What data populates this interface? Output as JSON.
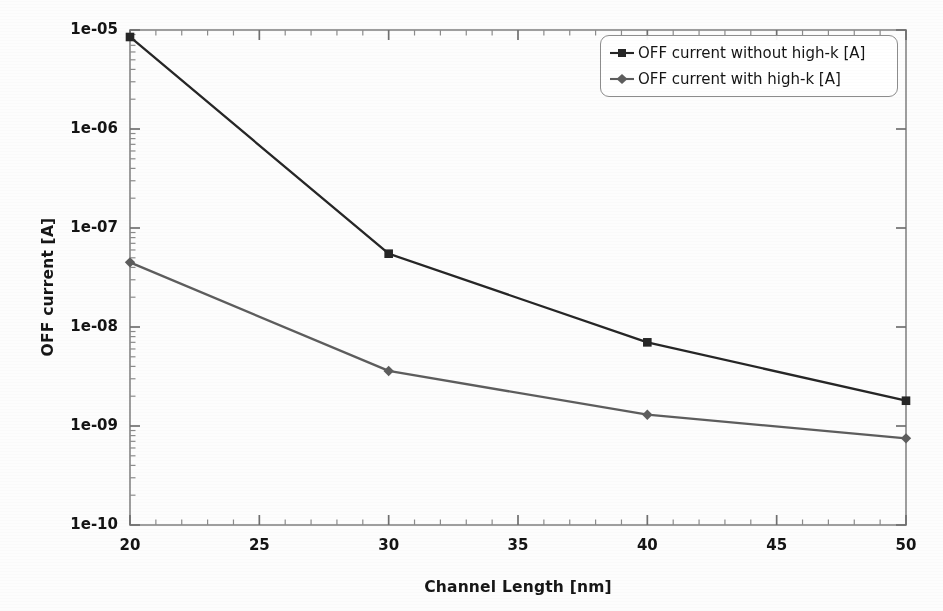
{
  "chart_data": {
    "type": "line",
    "title": "",
    "xlabel": "Channel Length [nm]",
    "ylabel": "OFF current [A]",
    "x": [
      20,
      30,
      40,
      50
    ],
    "xlim": [
      20,
      50
    ],
    "ylim": [
      1e-10,
      1e-05
    ],
    "yscale": "log",
    "xticks": [
      20,
      25,
      30,
      35,
      40,
      45,
      50
    ],
    "xtick_labels": [
      "20",
      "25",
      "30",
      "35",
      "40",
      "45",
      "50"
    ],
    "yticks": [
      1e-05,
      1e-06,
      1e-07,
      1e-08,
      1e-09,
      1e-10
    ],
    "ytick_labels": [
      "1e-05",
      "1e-06",
      "1e-07",
      "1e-08",
      "1e-09",
      "1e-10"
    ],
    "grid": false,
    "legend_position": "upper right",
    "series": [
      {
        "name": "OFF current without high-k [A]",
        "values": [
          8.5e-06,
          5.5e-08,
          7e-09,
          1.8e-09
        ],
        "color": "#262626",
        "marker": "square"
      },
      {
        "name": "OFF current with high-k [A]",
        "values": [
          4.5e-08,
          3.6e-09,
          1.3e-09,
          7.5e-10
        ],
        "color": "#5d5d5d",
        "marker": "diamond"
      }
    ]
  },
  "axes": {
    "ylabel_text": "OFF current [A]",
    "xlabel_text": "Channel Length [nm]",
    "ytick_labels": [
      "1e-05",
      "1e-06",
      "1e-07",
      "1e-08",
      "1e-09",
      "1e-10"
    ],
    "xtick_labels": [
      "20",
      "25",
      "30",
      "35",
      "40",
      "45",
      "50"
    ]
  },
  "legend": {
    "entries": [
      {
        "label": "OFF current without high-k [A]",
        "color": "#262626",
        "marker": "square"
      },
      {
        "label": "OFF current with high-k [A]",
        "color": "#5d5d5d",
        "marker": "diamond"
      }
    ]
  },
  "colors": {
    "series_1": "#262626",
    "series_2": "#5d5d5d",
    "axis": "#8d8d8d",
    "text": "#141414",
    "background": "#fdfdfd"
  }
}
